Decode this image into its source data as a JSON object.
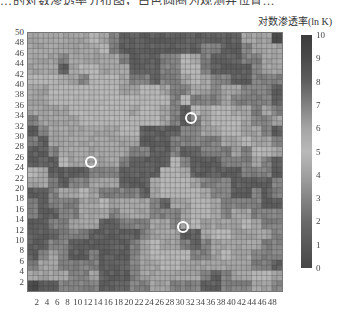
{
  "caption_fragment": "…的对数渗透率分布图，白色圆圈为观测井位置…",
  "colorbar": {
    "title": "对数渗透率(ln K)",
    "ticks": [
      "10",
      "9",
      "8",
      "7",
      "6",
      "5",
      "4",
      "3",
      "2",
      "1",
      "0"
    ],
    "min": 0,
    "max": 10,
    "colormap": [
      "#3a3a3a",
      "#5a5a5a",
      "#7a7a7a",
      "#9a9a9a",
      "#bdbdbd",
      "#d6d6d6",
      "#b5b5b5",
      "#8e8e8e",
      "#6a6a6a",
      "#4a4a4a",
      "#2e2e2e"
    ]
  },
  "chart_data": {
    "type": "heatmap",
    "title": "",
    "colorbar_label": "对数渗透率(ln K)",
    "x_ticks": [
      "2",
      "4",
      "6",
      "8",
      "10",
      "12",
      "14",
      "16",
      "18",
      "20",
      "22",
      "24",
      "26",
      "28",
      "30",
      "32",
      "34",
      "36",
      "38",
      "40",
      "42",
      "44",
      "46",
      "48"
    ],
    "y_ticks": [
      "50",
      "48",
      "46",
      "44",
      "42",
      "40",
      "38",
      "36",
      "34",
      "32",
      "30",
      "28",
      "26",
      "24",
      "22",
      "20",
      "18",
      "16",
      "14",
      "12",
      "10",
      "8",
      "6",
      "4",
      "2"
    ],
    "xlim": [
      0,
      50
    ],
    "ylim": [
      0,
      50
    ],
    "grid_size": [
      50,
      50
    ],
    "block_size": 2,
    "block_values_top_to_bottom": [
      [
        6,
        6,
        6,
        6,
        6,
        6,
        5,
        6,
        7,
        8,
        8,
        8,
        8,
        8,
        8,
        8,
        8,
        8,
        8,
        8,
        8,
        6,
        6,
        6,
        9
      ],
      [
        6,
        6,
        6,
        6,
        6,
        6,
        6,
        5,
        7,
        8,
        8,
        8,
        8,
        8,
        8,
        8,
        8,
        7,
        7,
        8,
        8,
        7,
        6,
        6,
        6
      ],
      [
        6,
        6,
        6,
        7,
        6,
        6,
        6,
        6,
        6,
        7,
        8,
        8,
        8,
        7,
        7,
        5,
        6,
        7,
        8,
        8,
        8,
        7,
        7,
        6,
        6
      ],
      [
        6,
        6,
        6,
        8,
        6,
        5,
        5,
        6,
        6,
        6,
        8,
        8,
        8,
        7,
        7,
        5,
        5,
        7,
        8,
        8,
        8,
        8,
        7,
        6,
        6
      ],
      [
        5,
        5,
        5,
        6,
        6,
        7,
        5,
        5,
        5,
        6,
        7,
        7,
        8,
        7,
        7,
        6,
        5,
        6,
        7,
        7,
        8,
        8,
        7,
        7,
        7
      ],
      [
        6,
        6,
        5,
        5,
        5,
        5,
        5,
        5,
        5,
        6,
        6,
        5,
        5,
        6,
        7,
        7,
        6,
        6,
        7,
        6,
        6,
        7,
        7,
        7,
        8
      ],
      [
        6,
        6,
        5,
        5,
        5,
        5,
        5,
        5,
        5,
        5,
        5,
        5,
        5,
        5,
        7,
        5,
        7,
        7,
        7,
        6,
        7,
        7,
        7,
        7,
        8
      ],
      [
        6,
        6,
        6,
        6,
        5,
        5,
        5,
        5,
        5,
        5,
        6,
        5,
        5,
        6,
        7,
        8,
        5,
        6,
        5,
        5,
        6,
        6,
        7,
        6,
        7
      ],
      [
        7,
        6,
        6,
        6,
        6,
        5,
        5,
        5,
        5,
        5,
        5,
        5,
        5,
        6,
        7,
        8,
        7,
        6,
        5,
        5,
        5,
        6,
        7,
        7,
        6
      ],
      [
        8,
        7,
        6,
        6,
        6,
        6,
        6,
        6,
        6,
        5,
        5,
        8,
        8,
        8,
        8,
        7,
        7,
        6,
        6,
        5,
        5,
        6,
        6,
        7,
        8
      ],
      [
        7,
        8,
        6,
        6,
        6,
        6,
        6,
        6,
        6,
        6,
        6,
        8,
        8,
        8,
        7,
        7,
        7,
        7,
        7,
        6,
        6,
        5,
        6,
        6,
        7
      ],
      [
        8,
        8,
        7,
        6,
        6,
        6,
        6,
        6,
        6,
        6,
        7,
        7,
        8,
        8,
        7,
        8,
        8,
        7,
        7,
        7,
        6,
        7,
        5,
        5,
        6
      ],
      [
        8,
        8,
        8,
        5,
        6,
        6,
        6,
        6,
        6,
        7,
        8,
        8,
        8,
        8,
        5,
        7,
        8,
        8,
        8,
        7,
        7,
        7,
        6,
        7,
        8
      ],
      [
        5,
        6,
        8,
        8,
        8,
        8,
        7,
        7,
        7,
        8,
        8,
        8,
        8,
        5,
        5,
        6,
        8,
        8,
        8,
        8,
        8,
        7,
        7,
        7,
        8
      ],
      [
        6,
        6,
        7,
        8,
        7,
        7,
        6,
        6,
        6,
        8,
        8,
        8,
        6,
        5,
        5,
        5,
        6,
        7,
        7,
        7,
        8,
        8,
        8,
        8,
        7
      ],
      [
        8,
        8,
        7,
        6,
        6,
        5,
        6,
        7,
        7,
        7,
        7,
        8,
        6,
        5,
        5,
        5,
        5,
        6,
        7,
        7,
        8,
        8,
        7,
        8,
        7
      ],
      [
        7,
        8,
        7,
        7,
        7,
        6,
        6,
        5,
        6,
        6,
        6,
        6,
        7,
        8,
        6,
        6,
        5,
        5,
        6,
        7,
        7,
        7,
        7,
        8,
        8
      ],
      [
        7,
        8,
        8,
        7,
        7,
        6,
        6,
        6,
        7,
        6,
        6,
        6,
        7,
        7,
        7,
        6,
        5,
        5,
        6,
        7,
        6,
        6,
        7,
        7,
        7
      ],
      [
        8,
        8,
        7,
        7,
        6,
        6,
        6,
        8,
        8,
        7,
        7,
        7,
        6,
        6,
        7,
        6,
        5,
        6,
        6,
        6,
        6,
        5,
        6,
        7,
        7
      ],
      [
        8,
        8,
        8,
        7,
        7,
        7,
        8,
        8,
        8,
        8,
        8,
        7,
        6,
        6,
        6,
        8,
        8,
        6,
        5,
        5,
        6,
        6,
        6,
        6,
        7
      ],
      [
        8,
        8,
        7,
        7,
        8,
        8,
        8,
        8,
        8,
        8,
        7,
        6,
        5,
        6,
        6,
        7,
        8,
        7,
        6,
        6,
        6,
        6,
        6,
        7,
        7
      ],
      [
        8,
        7,
        6,
        7,
        8,
        8,
        7,
        8,
        8,
        8,
        7,
        6,
        5,
        5,
        5,
        5,
        7,
        7,
        6,
        5,
        6,
        6,
        7,
        7,
        7
      ],
      [
        7,
        6,
        6,
        7,
        7,
        7,
        7,
        8,
        8,
        8,
        7,
        6,
        6,
        5,
        5,
        6,
        6,
        6,
        6,
        6,
        6,
        6,
        7,
        7,
        8
      ],
      [
        6,
        6,
        6,
        6,
        7,
        7,
        6,
        8,
        8,
        8,
        7,
        6,
        6,
        6,
        6,
        6,
        6,
        7,
        8,
        7,
        6,
        6,
        5,
        5,
        6
      ],
      [
        9,
        8,
        8,
        7,
        7,
        7,
        7,
        8,
        8,
        8,
        7,
        7,
        6,
        6,
        7,
        7,
        7,
        8,
        8,
        7,
        7,
        7,
        6,
        6,
        7
      ]
    ],
    "markers": [
      {
        "x": 32,
        "y": 33.5,
        "label": "well"
      },
      {
        "x": 12.5,
        "y": 25,
        "label": "well"
      },
      {
        "x": 30.5,
        "y": 12.5,
        "label": "well"
      }
    ]
  }
}
